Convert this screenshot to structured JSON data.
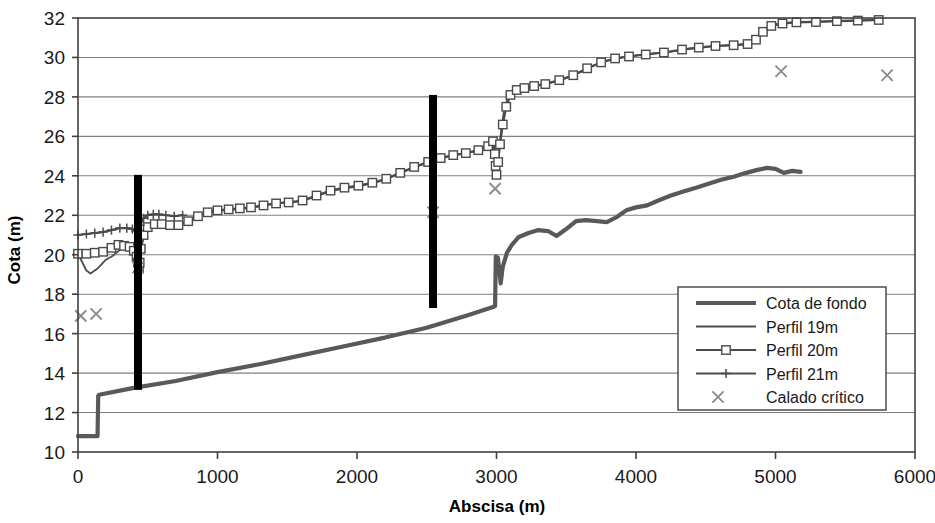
{
  "chart_data": {
    "type": "line",
    "title": "",
    "xlabel": "Abscisa (m)",
    "ylabel": "Cota (m)",
    "xlim": [
      0,
      6000
    ],
    "ylim": [
      10,
      32
    ],
    "xticks": [
      0,
      1000,
      2000,
      3000,
      4000,
      5000,
      6000
    ],
    "yticks": [
      10,
      12,
      14,
      16,
      18,
      20,
      22,
      24,
      26,
      28,
      30,
      32
    ],
    "grid": "horizontal",
    "legend_position": "bottom-right",
    "colors": {
      "cota_de_fondo": "#595959",
      "perfil_19m": "#4d4d4d",
      "perfil_20m": "#4a4a4a",
      "perfil_21m": "#4a4a4a",
      "calado_critico": "#8c8c8c",
      "marker_bar": "#000000",
      "axis": "#404040",
      "grid": "#808080",
      "background": "#ffffff"
    },
    "series": [
      {
        "name": "Cota de fondo",
        "marker": "none",
        "points": [
          [
            0,
            10.8
          ],
          [
            140,
            10.8
          ],
          [
            145,
            12.85
          ],
          [
            152,
            12.9
          ],
          [
            400,
            13.25
          ],
          [
            700,
            13.6
          ],
          [
            1000,
            14.05
          ],
          [
            1300,
            14.45
          ],
          [
            1600,
            14.9
          ],
          [
            1900,
            15.35
          ],
          [
            2200,
            15.8
          ],
          [
            2500,
            16.3
          ],
          [
            2800,
            16.95
          ],
          [
            2975,
            17.35
          ],
          [
            2990,
            17.4
          ],
          [
            2995,
            19.9
          ],
          [
            3010,
            19.85
          ],
          [
            3030,
            18.55
          ],
          [
            3045,
            19.4
          ],
          [
            3075,
            20.1
          ],
          [
            3110,
            20.5
          ],
          [
            3160,
            20.9
          ],
          [
            3230,
            21.1
          ],
          [
            3300,
            21.25
          ],
          [
            3370,
            21.2
          ],
          [
            3430,
            20.95
          ],
          [
            3500,
            21.3
          ],
          [
            3570,
            21.7
          ],
          [
            3640,
            21.75
          ],
          [
            3720,
            21.7
          ],
          [
            3790,
            21.65
          ],
          [
            3860,
            21.9
          ],
          [
            3930,
            22.25
          ],
          [
            4000,
            22.4
          ],
          [
            4080,
            22.5
          ],
          [
            4160,
            22.75
          ],
          [
            4250,
            23.0
          ],
          [
            4340,
            23.2
          ],
          [
            4430,
            23.4
          ],
          [
            4520,
            23.6
          ],
          [
            4610,
            23.8
          ],
          [
            4700,
            23.95
          ],
          [
            4790,
            24.15
          ],
          [
            4870,
            24.3
          ],
          [
            4940,
            24.4
          ],
          [
            5000,
            24.35
          ],
          [
            5060,
            24.15
          ],
          [
            5120,
            24.25
          ],
          [
            5180,
            24.2
          ]
        ]
      },
      {
        "name": "Perfil 19m",
        "marker": "none",
        "points": [
          [
            0,
            20.05
          ],
          [
            60,
            19.2
          ],
          [
            90,
            19.05
          ],
          [
            140,
            19.3
          ],
          [
            200,
            19.75
          ],
          [
            250,
            19.95
          ],
          [
            300,
            20.25
          ],
          [
            340,
            20.35
          ],
          [
            380,
            20.2
          ],
          [
            410,
            19.75
          ],
          [
            425,
            19.4
          ],
          [
            430,
            19.1
          ],
          [
            435,
            18.9
          ],
          [
            440,
            19.35
          ],
          [
            450,
            20.2
          ],
          [
            470,
            20.9
          ],
          [
            500,
            21.35
          ],
          [
            550,
            21.5
          ],
          [
            600,
            21.55
          ],
          [
            650,
            21.45
          ],
          [
            700,
            21.4
          ],
          [
            760,
            21.6
          ],
          [
            830,
            21.85
          ],
          [
            900,
            22.1
          ],
          [
            970,
            22.2
          ],
          [
            1050,
            22.25
          ],
          [
            1130,
            22.3
          ],
          [
            1210,
            22.35
          ],
          [
            1300,
            22.45
          ],
          [
            1400,
            22.6
          ],
          [
            1500,
            22.65
          ],
          [
            1600,
            22.7
          ],
          [
            1700,
            22.95
          ],
          [
            1800,
            23.2
          ],
          [
            1900,
            23.35
          ],
          [
            2000,
            23.45
          ],
          [
            2100,
            23.6
          ],
          [
            2200,
            23.8
          ],
          [
            2300,
            24.1
          ],
          [
            2400,
            24.4
          ],
          [
            2500,
            24.65
          ],
          [
            2580,
            24.85
          ],
          [
            2660,
            25.0
          ],
          [
            2740,
            25.1
          ],
          [
            2820,
            25.2
          ],
          [
            2900,
            25.35
          ],
          [
            2950,
            25.55
          ],
          [
            2980,
            25.8
          ],
          [
            2990,
            25.2
          ],
          [
            2995,
            24.55
          ],
          [
            3000,
            24.1
          ],
          [
            3010,
            24.6
          ],
          [
            3020,
            25.4
          ],
          [
            3035,
            26.4
          ],
          [
            3055,
            27.35
          ],
          [
            3080,
            27.95
          ],
          [
            3120,
            28.25
          ],
          [
            3170,
            28.4
          ],
          [
            3230,
            28.5
          ],
          [
            3300,
            28.6
          ],
          [
            3400,
            28.75
          ],
          [
            3500,
            28.95
          ],
          [
            3600,
            29.25
          ],
          [
            3700,
            29.6
          ],
          [
            3800,
            29.85
          ],
          [
            3900,
            30.0
          ],
          [
            4000,
            30.1
          ],
          [
            4120,
            30.2
          ],
          [
            4250,
            30.3
          ],
          [
            4380,
            30.45
          ],
          [
            4500,
            30.55
          ],
          [
            4620,
            30.6
          ],
          [
            4740,
            30.65
          ],
          [
            4820,
            30.7
          ],
          [
            4870,
            30.95
          ],
          [
            4920,
            31.35
          ],
          [
            4980,
            31.65
          ],
          [
            5060,
            31.75
          ],
          [
            5160,
            31.8
          ],
          [
            5300,
            31.82
          ],
          [
            5450,
            31.85
          ],
          [
            5600,
            31.88
          ],
          [
            5750,
            31.9
          ]
        ]
      },
      {
        "name": "Perfil 20m",
        "marker": "square",
        "points": [
          [
            0,
            20.05
          ],
          [
            60,
            20.05
          ],
          [
            120,
            20.1
          ],
          [
            180,
            20.15
          ],
          [
            240,
            20.35
          ],
          [
            290,
            20.5
          ],
          [
            330,
            20.45
          ],
          [
            370,
            20.4
          ],
          [
            400,
            20.2
          ],
          [
            420,
            19.9
          ],
          [
            430,
            19.6
          ],
          [
            437,
            19.3
          ],
          [
            442,
            19.6
          ],
          [
            450,
            20.3
          ],
          [
            470,
            21.0
          ],
          [
            500,
            21.4
          ],
          [
            550,
            21.55
          ],
          [
            600,
            21.55
          ],
          [
            660,
            21.5
          ],
          [
            720,
            21.5
          ],
          [
            790,
            21.7
          ],
          [
            860,
            21.95
          ],
          [
            930,
            22.15
          ],
          [
            1000,
            22.25
          ],
          [
            1080,
            22.3
          ],
          [
            1160,
            22.35
          ],
          [
            1240,
            22.4
          ],
          [
            1330,
            22.5
          ],
          [
            1420,
            22.6
          ],
          [
            1510,
            22.65
          ],
          [
            1610,
            22.75
          ],
          [
            1710,
            23.0
          ],
          [
            1810,
            23.25
          ],
          [
            1910,
            23.4
          ],
          [
            2010,
            23.5
          ],
          [
            2110,
            23.65
          ],
          [
            2210,
            23.85
          ],
          [
            2310,
            24.15
          ],
          [
            2410,
            24.45
          ],
          [
            2510,
            24.7
          ],
          [
            2600,
            24.9
          ],
          [
            2690,
            25.05
          ],
          [
            2780,
            25.15
          ],
          [
            2870,
            25.3
          ],
          [
            2940,
            25.5
          ],
          [
            2975,
            25.75
          ],
          [
            2988,
            25.1
          ],
          [
            2994,
            24.5
          ],
          [
            3000,
            24.05
          ],
          [
            3012,
            24.7
          ],
          [
            3025,
            25.6
          ],
          [
            3045,
            26.6
          ],
          [
            3070,
            27.5
          ],
          [
            3100,
            28.1
          ],
          [
            3145,
            28.35
          ],
          [
            3200,
            28.45
          ],
          [
            3270,
            28.55
          ],
          [
            3350,
            28.65
          ],
          [
            3450,
            28.85
          ],
          [
            3550,
            29.1
          ],
          [
            3650,
            29.45
          ],
          [
            3750,
            29.75
          ],
          [
            3850,
            29.95
          ],
          [
            3950,
            30.05
          ],
          [
            4070,
            30.15
          ],
          [
            4200,
            30.25
          ],
          [
            4330,
            30.4
          ],
          [
            4450,
            30.5
          ],
          [
            4570,
            30.58
          ],
          [
            4700,
            30.62
          ],
          [
            4800,
            30.68
          ],
          [
            4860,
            30.9
          ],
          [
            4910,
            31.3
          ],
          [
            4970,
            31.6
          ],
          [
            5050,
            31.72
          ],
          [
            5150,
            31.78
          ],
          [
            5290,
            31.8
          ],
          [
            5440,
            31.84
          ],
          [
            5590,
            31.87
          ],
          [
            5740,
            31.9
          ]
        ]
      },
      {
        "name": "Perfil 21m",
        "marker": "plus",
        "points": [
          [
            0,
            21.0
          ],
          [
            60,
            21.05
          ],
          [
            120,
            21.1
          ],
          [
            180,
            21.15
          ],
          [
            240,
            21.25
          ],
          [
            300,
            21.35
          ],
          [
            350,
            21.35
          ],
          [
            390,
            21.3
          ],
          [
            415,
            21.2
          ],
          [
            430,
            21.25
          ],
          [
            445,
            21.5
          ],
          [
            470,
            21.85
          ],
          [
            500,
            22.0
          ],
          [
            540,
            22.05
          ],
          [
            580,
            22.05
          ],
          [
            630,
            22.0
          ],
          [
            690,
            21.95
          ],
          [
            750,
            22.0
          ]
        ]
      },
      {
        "name": "Calado crítico",
        "marker": "cross",
        "line": "none",
        "points": [
          [
            20,
            16.9
          ],
          [
            130,
            17.0
          ],
          [
            430,
            19.35
          ],
          [
            2545,
            22.15
          ],
          [
            2990,
            23.35
          ],
          [
            5040,
            29.3
          ],
          [
            5800,
            29.1
          ]
        ]
      }
    ],
    "vertical_bars": [
      {
        "x": 430,
        "y0": 13.15,
        "y1": 24.05
      },
      {
        "x": 2545,
        "y0": 17.3,
        "y1": 28.1
      }
    ]
  },
  "legend": {
    "items": [
      {
        "label": "Cota de fondo",
        "marker": "none",
        "weight": "thick"
      },
      {
        "label": "Perfil 19m",
        "marker": "none",
        "weight": "thin"
      },
      {
        "label": "Perfil 20m",
        "marker": "square",
        "weight": "thin"
      },
      {
        "label": "Perfil 21m",
        "marker": "plus",
        "weight": "thin"
      },
      {
        "label": "Calado crítico",
        "marker": "cross",
        "weight": "none"
      }
    ]
  }
}
